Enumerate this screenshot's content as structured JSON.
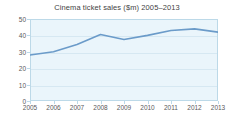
{
  "chart_data": {
    "type": "line",
    "title": "Cinema ticket sales ($m) 2005–2013",
    "xlabel": "",
    "ylabel": "",
    "categories": [
      "2005",
      "2006",
      "2007",
      "2008",
      "2009",
      "2010",
      "2011",
      "2012",
      "2013"
    ],
    "x": [
      2005,
      2006,
      2007,
      2008,
      2009,
      2010,
      2011,
      2012,
      2013
    ],
    "values": [
      28,
      30,
      34.5,
      40.5,
      37.5,
      40,
      43,
      44,
      42
    ],
    "series": [
      {
        "name": "Cinema ticket sales ($m)",
        "values": [
          28,
          30,
          34.5,
          40.5,
          37.5,
          40,
          43,
          44,
          42
        ]
      }
    ],
    "ylim": [
      0,
      50
    ],
    "yticks": [
      0,
      10,
      20,
      30,
      40,
      50
    ],
    "ytick_labels": [
      "0",
      "10",
      "20",
      "30",
      "40",
      "50"
    ],
    "xtick_labels": [
      "2005",
      "2006",
      "2007",
      "2008",
      "2009",
      "2010",
      "2011",
      "2012",
      "2013"
    ],
    "grid": true,
    "legend": false,
    "legend_position": "none",
    "line_color": "#6b9bc9",
    "plot_background": "#eaf5fb",
    "axis_color": "#bcd9e8",
    "grid_color": "#d6e8f2",
    "label_color": "#5a5a5a",
    "title_color": "#3f3f3f",
    "page_background": "#ffffff"
  }
}
